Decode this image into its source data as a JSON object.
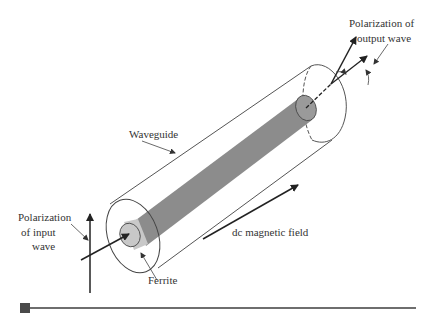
{
  "diagram": {
    "type": "Faraday rotation in ferrite-loaded circular waveguide",
    "labels": {
      "output_polarization_line1": "Polarization of",
      "output_polarization_line2": "output wave",
      "waveguide": "Waveguide",
      "input_polarization_line1": "Polarization",
      "input_polarization_line2": "of input",
      "input_polarization_line3": "wave",
      "dc_field": "dc magnetic field",
      "ferrite": "Ferrite"
    },
    "colors": {
      "ferrite_body": "#8c8c8c",
      "ferrite_cap": "#c8c8c8",
      "ferrite_cap_right": "#9a9a9a",
      "outline": "#444444",
      "arrow": "#222222",
      "footer_rule": "#6e6e6e",
      "footer_square": "#4a4a4a"
    }
  }
}
